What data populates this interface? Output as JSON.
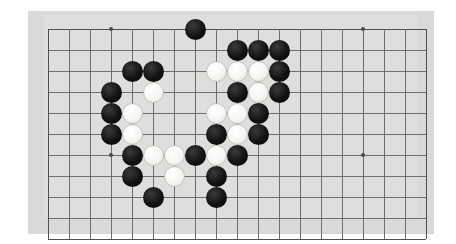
{
  "app": {
    "title": "Go Board Position",
    "surface_type": "goban"
  },
  "board": {
    "colors": {
      "frame": "#d9d9d7",
      "surface": "#dededc",
      "line": "#6e6e6e",
      "edge_line": "#4f4f4f",
      "black_stone": "#121212",
      "white_stone": "#f4f4f2",
      "star_point": "#4a4a4a",
      "background": "#ffffff"
    },
    "geometry": {
      "origin_x": 48,
      "origin_y": 29,
      "spacing": 21,
      "cols": 18,
      "rows": 10,
      "stone_diameter": 21,
      "frame_left": 28,
      "frame_top": 11,
      "frame_width": 406,
      "frame_height": 223,
      "surface_left": 44,
      "surface_top": 15,
      "surface_width": 374,
      "surface_height": 203
    },
    "star_points": [
      {
        "col": 3,
        "row": 0
      },
      {
        "col": 15,
        "row": 0
      },
      {
        "col": 3,
        "row": 6
      },
      {
        "col": 15,
        "row": 6
      }
    ],
    "stone_counts": {
      "black": 26,
      "white": 15,
      "total": 41
    },
    "stones": [
      {
        "col": 7,
        "row": 0,
        "color": "black"
      },
      {
        "col": 9,
        "row": 1,
        "color": "black"
      },
      {
        "col": 10,
        "row": 1,
        "color": "black"
      },
      {
        "col": 11,
        "row": 1,
        "color": "black"
      },
      {
        "col": 4,
        "row": 2,
        "color": "black"
      },
      {
        "col": 5,
        "row": 2,
        "color": "black"
      },
      {
        "col": 8,
        "row": 2,
        "color": "white"
      },
      {
        "col": 9,
        "row": 2,
        "color": "white"
      },
      {
        "col": 10,
        "row": 2,
        "color": "white"
      },
      {
        "col": 11,
        "row": 2,
        "color": "black"
      },
      {
        "col": 3,
        "row": 3,
        "color": "black"
      },
      {
        "col": 5,
        "row": 3,
        "color": "white"
      },
      {
        "col": 9,
        "row": 3,
        "color": "black"
      },
      {
        "col": 10,
        "row": 3,
        "color": "white"
      },
      {
        "col": 11,
        "row": 3,
        "color": "black"
      },
      {
        "col": 3,
        "row": 4,
        "color": "black"
      },
      {
        "col": 4,
        "row": 4,
        "color": "white"
      },
      {
        "col": 8,
        "row": 4,
        "color": "white"
      },
      {
        "col": 9,
        "row": 4,
        "color": "white"
      },
      {
        "col": 10,
        "row": 4,
        "color": "black"
      },
      {
        "col": 3,
        "row": 5,
        "color": "black"
      },
      {
        "col": 4,
        "row": 5,
        "color": "white"
      },
      {
        "col": 8,
        "row": 5,
        "color": "black"
      },
      {
        "col": 9,
        "row": 5,
        "color": "white"
      },
      {
        "col": 10,
        "row": 5,
        "color": "black"
      },
      {
        "col": 4,
        "row": 6,
        "color": "black"
      },
      {
        "col": 5,
        "row": 6,
        "color": "white"
      },
      {
        "col": 6,
        "row": 6,
        "color": "white"
      },
      {
        "col": 7,
        "row": 6,
        "color": "black"
      },
      {
        "col": 8,
        "row": 6,
        "color": "white"
      },
      {
        "col": 9,
        "row": 6,
        "color": "black"
      },
      {
        "col": 4,
        "row": 7,
        "color": "black"
      },
      {
        "col": 6,
        "row": 7,
        "color": "white"
      },
      {
        "col": 8,
        "row": 7,
        "color": "black"
      },
      {
        "col": 5,
        "row": 8,
        "color": "black"
      },
      {
        "col": 8,
        "row": 8,
        "color": "black"
      }
    ]
  }
}
